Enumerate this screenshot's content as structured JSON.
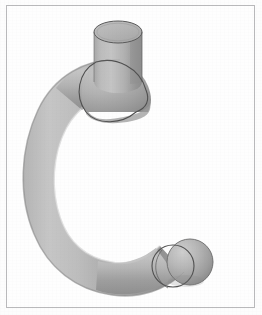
{
  "page": {
    "background_color": "#fdfdfd",
    "width": 262,
    "height": 315
  },
  "frame": {
    "border_color": "#b9b9bb",
    "border_width": 1,
    "inset_left": 6,
    "inset_top": 5,
    "width": 249,
    "height": 303
  },
  "illustration": {
    "subject": "curved-pipe-elbow",
    "description": "Grayscale shaded 3D rendering of a C-shaped curved pipe with a vertical cylindrical stub at the upper right joined by a 90 degree elbow, and a rounded spherical end cap at the lower right.",
    "render_style": "smooth-shaded-grayscale",
    "light_direction": "upper-left",
    "colors": {
      "highlight": "#cfcfcf",
      "midtone": "#a9a9a9",
      "shadow": "#8a8a8a",
      "deep_shadow": "#787878",
      "outline": "#4a4a4a",
      "cap_face": "#b5b5b5",
      "background": "#fefefe"
    },
    "parts": [
      {
        "name": "vertical-cylinder-stub",
        "label": "Vertical cylinder stub",
        "center_x": 118,
        "center_y": 55,
        "radius_x": 24,
        "radius_y": 11,
        "height": 50
      },
      {
        "name": "top-elliptical-cap",
        "label": "Top elliptical end face",
        "center_x": 118,
        "center_y": 32,
        "radius_x": 24,
        "radius_y": 11
      },
      {
        "name": "elbow-joint",
        "label": "90 degree elbow joint",
        "center_x": 105,
        "center_y": 90
      },
      {
        "name": "seam-ring-upper",
        "label": "Upper seam ring",
        "center_x": 100,
        "center_y": 78,
        "radius": 24
      },
      {
        "name": "curved-body",
        "label": "C-shaped curved pipe body",
        "sweep_start_deg": 25,
        "sweep_end_deg": 290,
        "tube_radius": 23
      },
      {
        "name": "seam-ring-lower",
        "label": "Lower seam ring",
        "center_x": 176,
        "center_y": 265,
        "radius": 21
      },
      {
        "name": "spherical-end-cap",
        "label": "Rounded spherical end cap",
        "center_x": 188,
        "center_y": 262,
        "radius": 22
      }
    ]
  }
}
